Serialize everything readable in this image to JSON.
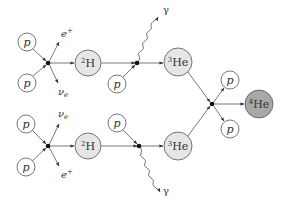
{
  "colors": {
    "stroke": "#555555",
    "light_fill": "#e6e6e6",
    "helium4_fill": "#a8a8a8",
    "vertex": "#111111",
    "text": "#333333"
  },
  "nodes": {
    "p_top_1": {
      "label": "p",
      "x": 27,
      "y": 42,
      "r": 9
    },
    "p_top_2": {
      "label": "p",
      "x": 27,
      "y": 83,
      "r": 9
    },
    "h2_top": {
      "label_sup": "2",
      "label": "H",
      "x": 88,
      "y": 63,
      "r": 13
    },
    "p_top_3": {
      "label": "p",
      "x": 117,
      "y": 84,
      "r": 9
    },
    "he3_top": {
      "label_sup": "3",
      "label": "He",
      "x": 178,
      "y": 62,
      "r": 14
    },
    "p_bot_1": {
      "label": "p",
      "x": 26,
      "y": 124,
      "r": 9
    },
    "p_bot_2": {
      "label": "p",
      "x": 26,
      "y": 167,
      "r": 9
    },
    "h2_bot": {
      "label_sup": "2",
      "label": "H",
      "x": 88,
      "y": 146,
      "r": 13
    },
    "p_bot_3": {
      "label": "p",
      "x": 117,
      "y": 123,
      "r": 9
    },
    "he3_bot": {
      "label_sup": "3",
      "label": "He",
      "x": 178,
      "y": 146,
      "r": 14
    },
    "p_out_1": {
      "label": "p",
      "x": 230,
      "y": 80,
      "r": 9
    },
    "p_out_2": {
      "label": "p",
      "x": 230,
      "y": 129,
      "r": 9
    },
    "he4": {
      "label_sup": "4",
      "label": "He",
      "x": 259,
      "y": 104,
      "r": 14
    }
  },
  "emissions": {
    "positron_top": {
      "label": "e",
      "label_sup": "+"
    },
    "neutrino_top": {
      "label": "ν",
      "label_sub": "e"
    },
    "neutrino_bot": {
      "label": "ν",
      "label_sub": "e"
    },
    "positron_bot": {
      "label": "e",
      "label_sup": "+"
    },
    "gamma_top": {
      "label": "γ"
    },
    "gamma_bot": {
      "label": "γ"
    }
  }
}
